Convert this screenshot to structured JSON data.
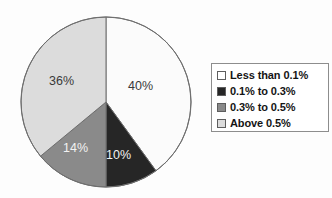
{
  "chart_data": {
    "type": "pie",
    "title": "",
    "categories": [
      "Less than 0.1%",
      "0.1% to 0.3%",
      "0.3% to 0.5%",
      "Above 0.5%"
    ],
    "values": [
      40,
      10,
      14,
      36
    ],
    "data_labels": [
      "40%",
      "10%",
      "14%",
      "36%"
    ],
    "colors": [
      "#fbfbfb",
      "#262626",
      "#8a8a8a",
      "#dcdcdc"
    ],
    "start_angle_deg": 0,
    "direction": "clockwise",
    "legend_position": "right",
    "grid": false,
    "xlabel": "",
    "ylabel": ""
  },
  "pie": {
    "center_x": 106,
    "center_y": 102,
    "radius": 85,
    "outline_color": "#6e6e6e",
    "slices": [
      {
        "label": "40%",
        "value": 40,
        "category": "Less than 0.1%",
        "fill": "#fbfbfb",
        "text_class": "dark-text",
        "label_x": 128,
        "label_y": 79
      },
      {
        "label": "10%",
        "value": 10,
        "category": "0.1% to 0.3%",
        "fill": "#262626",
        "text_class": "light-text",
        "label_x": 106,
        "label_y": 148
      },
      {
        "label": "14%",
        "value": 14,
        "category": "0.3% to 0.5%",
        "fill": "#8a8a8a",
        "text_class": "light-text",
        "label_x": 63,
        "label_y": 141
      },
      {
        "label": "36%",
        "value": 36,
        "category": "Above 0.5%",
        "fill": "#dcdcdc",
        "text_class": "dark-text",
        "label_x": 49,
        "label_y": 74
      }
    ]
  },
  "legend": {
    "items": [
      {
        "label": "Less than 0.1%",
        "swatch_color": "#ffffff"
      },
      {
        "label": "0.1% to 0.3%",
        "swatch_color": "#262626"
      },
      {
        "label": "0.3% to 0.5%",
        "swatch_color": "#8a8a8a"
      },
      {
        "label": "Above 0.5%",
        "swatch_color": "#dcdcdc"
      }
    ]
  }
}
